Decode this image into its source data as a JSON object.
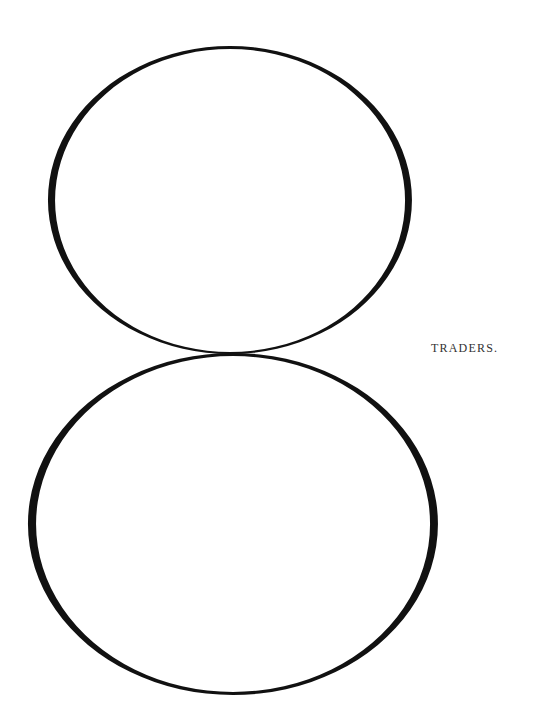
{
  "page": {
    "label": "TRADERS.",
    "ink_color": "#111111",
    "label_color": "#333333",
    "background": "#ffffff"
  },
  "figure": {
    "shapes": [
      {
        "name": "upper-oval",
        "cx": 230,
        "cy": 200,
        "rx": 180,
        "ry": 153
      },
      {
        "name": "lower-oval",
        "cx": 233,
        "cy": 523,
        "rx": 203,
        "ry": 170
      }
    ]
  }
}
